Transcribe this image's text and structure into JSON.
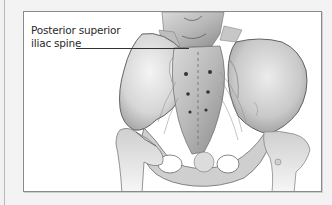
{
  "figure": {
    "labels": [
      {
        "line1": "Posterior superior",
        "line2": "iliac spine"
      }
    ]
  },
  "colors": {
    "background": "#f1f1f1",
    "frame_fill": "#ffffff",
    "frame_border": "#8a8a8a",
    "label_text": "#2a2a2a",
    "leader_line": "#333333"
  }
}
